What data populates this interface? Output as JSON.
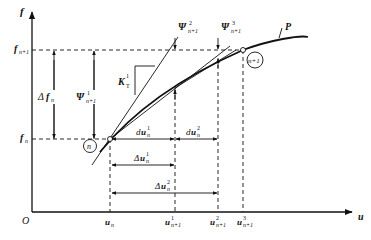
{
  "diagram": {
    "title": "",
    "axes": {
      "y_label": "f",
      "x_label": "u",
      "origin_label": "O"
    },
    "curve_label": "P",
    "points": [
      {
        "label": "n",
        "x_label": "u_n",
        "y_label": "f_n"
      },
      {
        "label": "n+1",
        "y_label": "f_n+1"
      }
    ],
    "y_levels": {
      "f_n_base": "f",
      "f_n_sub": "n",
      "f_n1_base": "f",
      "f_n1_sub": "n+1"
    },
    "x_ticks": [
      {
        "base": "u",
        "sup": "",
        "sub": "n"
      },
      {
        "base": "u",
        "sup": "1",
        "sub": "n+1"
      },
      {
        "base": "u",
        "sup": "2",
        "sub": "n+1"
      },
      {
        "base": "u",
        "sup": "3",
        "sub": "n+1"
      }
    ],
    "annotations": {
      "delta_f": {
        "prefix": "Δ",
        "base": "f",
        "sub": "n"
      },
      "psi1": {
        "base": "Ψ",
        "sup": "1",
        "sub": "n+1"
      },
      "psi2": {
        "base": "Ψ",
        "sup": "2",
        "sub": "n+1"
      },
      "psi3": {
        "base": "Ψ",
        "sup": "3",
        "sub": "n+1"
      },
      "kt": {
        "base": "K",
        "sup": "1",
        "sub": "T"
      },
      "du1": {
        "prefix": "d",
        "base": "u",
        "sup": "1",
        "sub": "n"
      },
      "du2": {
        "prefix": "d",
        "base": "u",
        "sup": "2",
        "sub": "n"
      },
      "Du1": {
        "prefix": "Δ",
        "base": "u",
        "sup": "1",
        "sub": "n"
      },
      "Du2": {
        "prefix": "Δ",
        "base": "u",
        "sup": "2",
        "sub": "n"
      }
    },
    "point_labels": {
      "n": "n",
      "n1": "n+1"
    }
  }
}
